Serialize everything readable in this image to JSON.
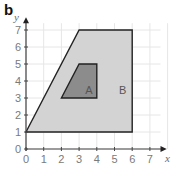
{
  "part_label": "b",
  "axes": {
    "x_label": "x",
    "y_label": "y",
    "x_ticks": [
      "0",
      "1",
      "2",
      "3",
      "4",
      "5",
      "6",
      "7"
    ],
    "y_ticks": [
      "0",
      "1",
      "2",
      "3",
      "4",
      "5",
      "6",
      "7"
    ],
    "xlim": [
      0,
      7
    ],
    "ylim": [
      0,
      7
    ]
  },
  "shapes": {
    "B": {
      "label": "B",
      "vertices": [
        [
          0,
          1
        ],
        [
          6,
          1
        ],
        [
          6,
          7
        ],
        [
          3,
          7
        ]
      ],
      "fill": "#d3d3d3"
    },
    "A": {
      "label": "A",
      "vertices": [
        [
          2,
          3
        ],
        [
          4,
          3
        ],
        [
          4,
          5
        ],
        [
          3,
          5
        ]
      ],
      "fill": "#8c8c8c"
    }
  },
  "colors": {
    "grid": "#e6e6e6",
    "axis": "#444444",
    "outline": "#222222"
  }
}
